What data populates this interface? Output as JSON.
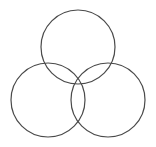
{
  "figure": {
    "name": "three-overlapping-circles",
    "canvas": {
      "width": 156,
      "height": 147,
      "background_color": "#ffffff"
    },
    "style": {
      "stroke_color": "#4a4a4a",
      "stroke_width": 1.2,
      "fill": "none"
    },
    "shapes": [
      {
        "id": "circle-top",
        "label": "Top circle",
        "cx": 78,
        "cy": 47,
        "r": 37
      },
      {
        "id": "circle-bottom-left",
        "label": "Bottom left circle",
        "cx": 48,
        "cy": 100,
        "r": 37
      },
      {
        "id": "circle-bottom-right",
        "label": "Bottom right circle",
        "cx": 108,
        "cy": 100,
        "r": 37
      }
    ],
    "intersection_nodes": [
      {
        "id": "node-upper-left",
        "x": 42,
        "y": 62
      },
      {
        "id": "node-upper-right",
        "x": 113,
        "y": 62
      },
      {
        "id": "node-bottom-center",
        "x": 78,
        "y": 118
      }
    ]
  }
}
